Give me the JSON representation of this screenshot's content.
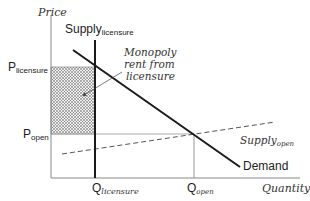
{
  "diagram": {
    "type": "supply-demand",
    "axes": {
      "y_label": "Price",
      "x_label": "Quantity"
    },
    "price_levels": [
      {
        "main": "P",
        "sub": "licensure"
      },
      {
        "main": "P",
        "sub": "open"
      }
    ],
    "quantity_levels": [
      {
        "main": "Q",
        "sub": "licensure"
      },
      {
        "main": "Q",
        "sub": "open"
      }
    ],
    "curves": {
      "supply_licensure": {
        "main": "Supply",
        "sub": "licensure",
        "style": "solid-vertical"
      },
      "supply_open": {
        "main": "Supply",
        "sub": "open",
        "style": "dashed"
      },
      "demand": {
        "label": "Demand",
        "style": "solid"
      }
    },
    "annotation": {
      "lines": [
        "Monopoly",
        "rent from",
        "licensure"
      ]
    },
    "colors": {
      "axis": "#888888",
      "curve": "#1a1a1a",
      "guide": "#aaaaaa",
      "hatch": "#555555"
    }
  }
}
